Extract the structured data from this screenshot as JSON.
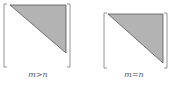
{
  "figure": {
    "panels": [
      {
        "id": "tall",
        "label": "m>n",
        "bracket": {
          "x1": 4,
          "y1": 4,
          "x2": 70,
          "y2": 67
        },
        "triangle": {
          "points": "10,5 66,5 66,53"
        },
        "label_pos": {
          "x": 38,
          "y": 70
        }
      },
      {
        "id": "square",
        "label": "m=n",
        "bracket": {
          "x1": 104,
          "y1": 13,
          "x2": 167,
          "y2": 68
        },
        "triangle": {
          "points": "108,14 163,14 163,63"
        },
        "label_pos": {
          "x": 134,
          "y": 70
        }
      }
    ],
    "colors": {
      "fill": "#b3b3b3",
      "stroke": "#555555",
      "bracket": "#888888"
    }
  }
}
